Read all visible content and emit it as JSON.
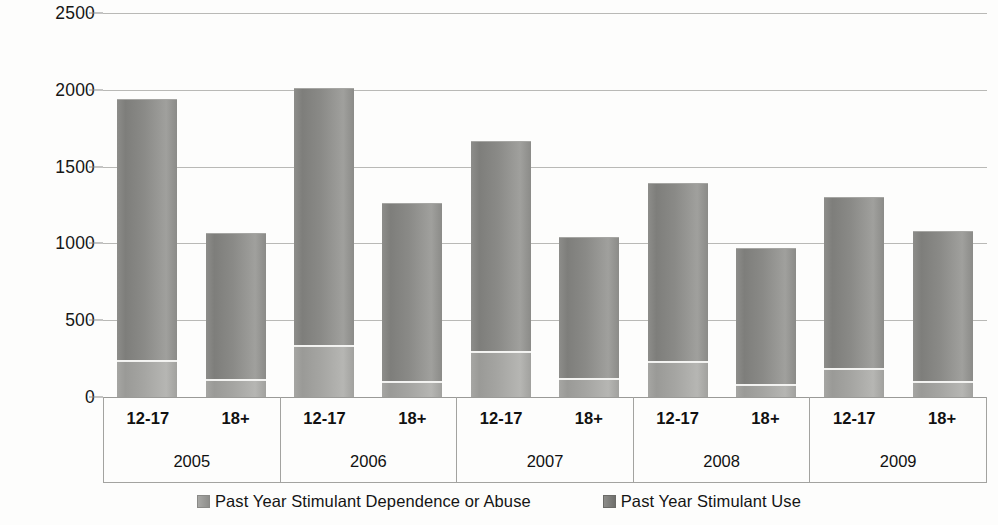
{
  "chart_data": {
    "type": "bar",
    "subtype": "stacked-column",
    "title": "",
    "xlabel": "",
    "ylabel": "",
    "ylim": [
      0,
      2500
    ],
    "ytick_values": [
      0,
      500,
      1000,
      1500,
      2000,
      2500
    ],
    "ytick_labels": [
      "0",
      "500",
      "1000",
      "1500",
      "2000",
      "2500"
    ],
    "grid": true,
    "legend_position": "bottom",
    "group_labels": [
      "2005",
      "2006",
      "2007",
      "2008",
      "2009"
    ],
    "categories": [
      "2005 12-17",
      "2005 18+",
      "2006 12-17",
      "2006 18+",
      "2007 12-17",
      "2007 18+",
      "2008 12-17",
      "2008 18+",
      "2009 12-17",
      "2009 18+"
    ],
    "age_labels": [
      "12-17",
      "18+"
    ],
    "series": [
      {
        "name": "Past Year Stimulant Dependence or Abuse",
        "color": "#a5a5a2",
        "values": [
          235,
          110,
          330,
          95,
          295,
          120,
          230,
          80,
          180,
          100
        ]
      },
      {
        "name": "Past Year Stimulant Use",
        "color": "#888885",
        "values": [
          1705,
          955,
          1685,
          1165,
          1375,
          925,
          1165,
          890,
          1120,
          980
        ]
      }
    ],
    "totals": [
      1940,
      1065,
      2015,
      1260,
      1670,
      1045,
      1395,
      970,
      1300,
      1080
    ]
  },
  "legend": {
    "items": [
      {
        "label": "Past Year Stimulant Dependence or Abuse",
        "swatch": "dep"
      },
      {
        "label": "Past Year Stimulant Use",
        "swatch": "use"
      }
    ]
  },
  "axis": {
    "groups": [
      {
        "year": "2005",
        "ages": [
          "12-17",
          "18+"
        ]
      },
      {
        "year": "2006",
        "ages": [
          "12-17",
          "18+"
        ]
      },
      {
        "year": "2007",
        "ages": [
          "12-17",
          "18+"
        ]
      },
      {
        "year": "2008",
        "ages": [
          "12-17",
          "18+"
        ]
      },
      {
        "year": "2009",
        "ages": [
          "12-17",
          "18+"
        ]
      }
    ]
  },
  "colors": {
    "gridline": "#b9b9b6",
    "axis_line": "#a3a3a0",
    "text": "#161616",
    "background": "#fdfdfc"
  }
}
